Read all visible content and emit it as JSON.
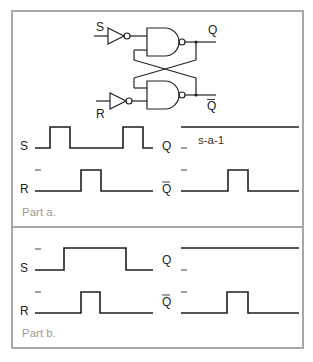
{
  "circuit": {
    "input_s": "S",
    "input_r": "R",
    "output_q": "Q",
    "output_qbar": "Q",
    "gates": [
      "inverter-s",
      "nand-top",
      "inverter-r",
      "nand-bottom"
    ]
  },
  "part_a": {
    "caption": "Part a.",
    "signals": {
      "s_label": "S",
      "r_label": "R",
      "q_label": "Q",
      "qbar_label": "Q"
    },
    "fault_annotation": "s-a-1",
    "waveforms": {
      "S": [
        0,
        1,
        0,
        0,
        1,
        0
      ],
      "R": [
        0,
        0,
        1,
        0,
        0
      ],
      "Q": [
        1
      ],
      "Qbar": [
        0,
        0,
        1,
        0,
        0
      ]
    }
  },
  "part_b": {
    "caption": "Part b.",
    "signals": {
      "s_label": "S",
      "r_label": "R",
      "q_label": "Q",
      "qbar_label": "Q"
    },
    "waveforms": {
      "S": [
        0,
        1,
        1,
        1,
        0
      ],
      "R": [
        0,
        0,
        1,
        0,
        0
      ],
      "Q": [
        1
      ],
      "Qbar": [
        0,
        0,
        1,
        0,
        0
      ]
    }
  },
  "colors": {
    "frame": "#a8a8a8",
    "ink": "#1e1e1e",
    "caption": "#9a9a9a"
  }
}
